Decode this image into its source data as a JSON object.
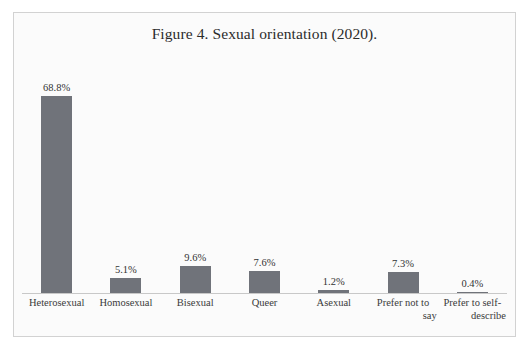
{
  "chart_data": {
    "type": "bar",
    "title": "Figure 4. Sexual orientation (2020).",
    "xlabel": "",
    "ylabel": "",
    "grid": false,
    "legend": false,
    "ylim": [
      0,
      72
    ],
    "bar_color": "#70737a",
    "background_color": "#fbfbfb",
    "border_color": "#d2d2d2",
    "categories": [
      "Heterosexual",
      "Homosexual",
      "Bisexual",
      "Queer",
      "Asexual",
      "Prefer not to say",
      "Prefer to self-describe"
    ],
    "values": [
      68.8,
      5.1,
      9.6,
      7.6,
      1.2,
      7.3,
      0.4
    ],
    "value_labels": [
      "68.8%",
      "5.1%",
      "9.6%",
      "7.6%",
      "1.2%",
      "7.3%",
      "0.4%"
    ],
    "category_label_lines": [
      [
        "Heterosexual"
      ],
      [
        "Homosexual"
      ],
      [
        "Bisexual"
      ],
      [
        "Queer"
      ],
      [
        "Asexual"
      ],
      [
        "Prefer not to",
        "say"
      ],
      [
        "Prefer to self-",
        "describe"
      ]
    ]
  }
}
